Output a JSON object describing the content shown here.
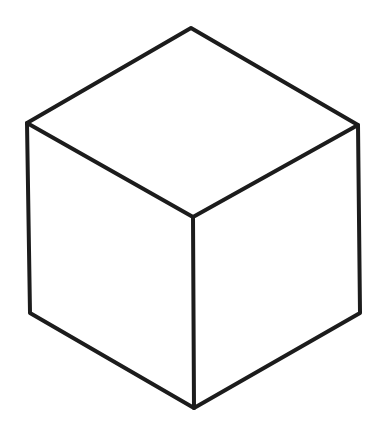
{
  "diagram": {
    "stroke_color": "#1c1c1c",
    "background": "#ffffff",
    "stroke_width": 4,
    "vertices": {
      "top": [
        191,
        28
      ],
      "left": [
        27,
        123
      ],
      "right": [
        358,
        125
      ],
      "center": [
        193,
        217
      ],
      "bottom_left": [
        30,
        313
      ],
      "bottom_right": [
        360,
        313
      ],
      "bottom": [
        194,
        408
      ]
    },
    "faces": [
      "top",
      "left",
      "right"
    ]
  }
}
